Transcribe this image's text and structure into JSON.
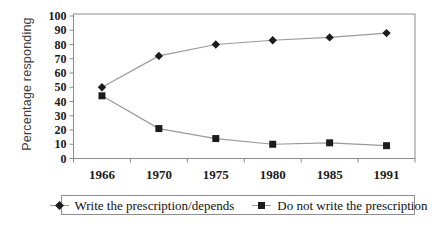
{
  "chart_data": {
    "type": "line",
    "title": "",
    "xlabel": "",
    "ylabel": "Percentage responding",
    "categories": [
      "1966",
      "1970",
      "1975",
      "1980",
      "1985",
      "1991"
    ],
    "series": [
      {
        "name": "Write the prescription/depends",
        "marker": "diamond",
        "values": [
          50,
          72,
          80,
          83,
          85,
          88
        ]
      },
      {
        "name": "Do not write the prescription",
        "marker": "square",
        "values": [
          44,
          21,
          14,
          10,
          11,
          9
        ]
      }
    ],
    "ylim": [
      0,
      100
    ],
    "ytick_step": 10,
    "grid": false,
    "legend_position": "bottom",
    "colors": {
      "line": "#9a9a9a",
      "marker": "#1c1c1c",
      "axis": "#8c8c8c",
      "tick_label": "#1a1a1a"
    }
  }
}
